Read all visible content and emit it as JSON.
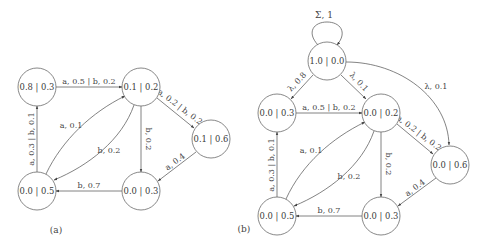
{
  "figure_a": {
    "caption": "(a)",
    "nodes": {
      "n1": "0.8 | 0.3",
      "n2": "0.1 | 0.2",
      "n3": "0.1 | 0.6",
      "n4": "0.0 | 0.5",
      "n5": "0.0 | 0.3"
    },
    "edges": {
      "n1_n2": "a, 0.5 | b, 0.2",
      "n2_n3": "a, 0.2 | b, 0.2",
      "n2_n5": "b, 0.2",
      "n4_n2": "a, 0.1",
      "n2_n4": "b, 0.2",
      "n4_n1": "a, 0.3 | b, 0.1",
      "n3_n5": "a, 0.4",
      "n5_n4": "b, 0.7"
    }
  },
  "figure_b": {
    "caption": "(b)",
    "nodes": {
      "n0": "1.0 | 0.0",
      "n1": "0.0 | 0.3",
      "n2": "0.0 | 0.2",
      "n3": "0.0 | 0.6",
      "n4": "0.0 | 0.5",
      "n5": "0.0 | 0.3"
    },
    "edges": {
      "n0_self": "Σ, 1",
      "n0_n1": "λ, 0.8",
      "n0_n2": "λ, 0.1",
      "n0_n3": "λ, 0.1",
      "n1_n2": "a, 0.5 | b, 0.2",
      "n2_n3": "a, 0.2 | b, 0.2",
      "n2_n5": "b, 0.2",
      "n4_n2": "a, 0.1",
      "n2_n4": "b, 0.2",
      "n4_n1": "a, 0.3 | b, 0.1",
      "n3_n5": "a, 0.4",
      "n5_n4": "b, 0.7"
    }
  }
}
